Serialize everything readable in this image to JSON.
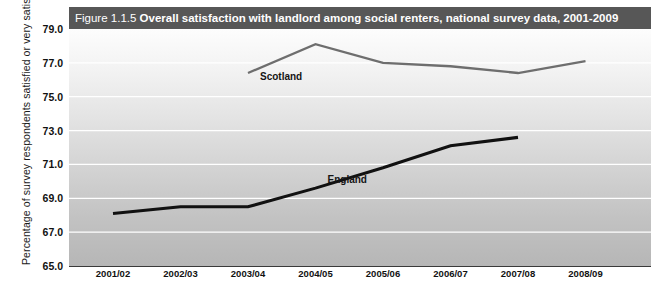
{
  "title": {
    "figure_number": "Figure 1.1.5",
    "main": "Overall satisfaction with landlord among social renters, national survey data, 2001-2009"
  },
  "axis": {
    "ylabel": "Percentage of survey respondents satisfied or very satisfied"
  },
  "colors": {
    "titlebar_bg": "#575757",
    "england_line": "#111111",
    "scotland_line": "#6e6e6e",
    "gridline": "#ffffff"
  },
  "chart_data": {
    "type": "line",
    "title": "Overall satisfaction with landlord among social renters, national survey data, 2001-2009",
    "xlabel": "",
    "ylabel": "Percentage of survey respondents satisfied or very satisfied",
    "categories": [
      "2001/02",
      "2002/03",
      "2003/04",
      "2004/05",
      "2005/06",
      "2006/07",
      "2007/08",
      "2008/09"
    ],
    "ylim": [
      65.0,
      79.0
    ],
    "ytick_labels": [
      "65.0",
      "67.0",
      "69.0",
      "71.0",
      "73.0",
      "75.0",
      "77.0",
      "79.0"
    ],
    "ytick_values": [
      65.0,
      67.0,
      69.0,
      71.0,
      73.0,
      75.0,
      77.0,
      79.0
    ],
    "grid": true,
    "legend": "inline-annotations",
    "series": [
      {
        "name": "England",
        "color": "#111111",
        "x": [
          "2001/02",
          "2002/03",
          "2003/04",
          "2004/05",
          "2005/06",
          "2006/07",
          "2007/08"
        ],
        "values": [
          68.1,
          68.5,
          68.5,
          69.6,
          70.8,
          72.1,
          72.6
        ]
      },
      {
        "name": "Scotland",
        "color": "#6e6e6e",
        "x": [
          "2003/04",
          "2004/05",
          "2005/06",
          "2006/07",
          "2007/08",
          "2008/09"
        ],
        "values": [
          76.4,
          78.1,
          77.0,
          76.8,
          76.4,
          77.1
        ]
      }
    ],
    "annotations": [
      {
        "text": "Scotland",
        "x": "2003/04",
        "y": 76.0
      },
      {
        "text": "England",
        "x": "2004/05",
        "y": 69.9
      }
    ]
  }
}
